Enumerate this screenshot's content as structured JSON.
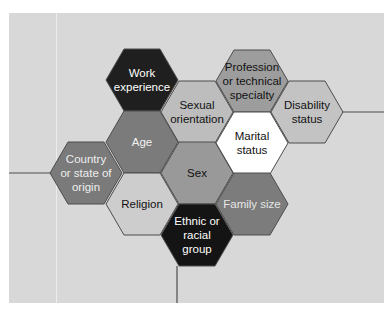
{
  "diagram": {
    "type": "hexagon-cluster",
    "hex_size": {
      "width": 72,
      "height": 62
    },
    "colors": {
      "panel_background": "#d8d8d8",
      "page_background": "#ffffff",
      "hex_border": "#4d4d4d",
      "connector_line": "#4d4d4d"
    },
    "hexagons": [
      {
        "id": "work-experience",
        "lines": [
          "Work",
          "experience"
        ],
        "cx": 142,
        "cy": 80,
        "fill": "#1f1f1f",
        "text_color": "#ffffff"
      },
      {
        "id": "profession",
        "lines": [
          "Profession",
          "or technical",
          "specialty"
        ],
        "cx": 252,
        "cy": 81,
        "fill": "#9d9d9d",
        "text_color": "#111111"
      },
      {
        "id": "sexual-orientation",
        "lines": [
          "Sexual",
          "orientation"
        ],
        "cx": 197,
        "cy": 112,
        "fill": "#bdbdbd",
        "text_color": "#111111"
      },
      {
        "id": "disability-status",
        "lines": [
          "Disability",
          "status"
        ],
        "cx": 307,
        "cy": 112,
        "fill": "#c3c3c3",
        "text_color": "#111111"
      },
      {
        "id": "age",
        "lines": [
          "Age"
        ],
        "cx": 142,
        "cy": 142,
        "fill": "#7b7b7b",
        "text_color": "#f2f2f2"
      },
      {
        "id": "marital-status",
        "lines": [
          "Marital",
          "status"
        ],
        "cx": 252,
        "cy": 143,
        "fill": "#ffffff",
        "text_color": "#111111"
      },
      {
        "id": "country-of-origin",
        "lines": [
          "Country",
          "or state of",
          "origin"
        ],
        "cx": 86,
        "cy": 173,
        "fill": "#7a7a7a",
        "text_color": "#eeeeee"
      },
      {
        "id": "sex",
        "lines": [
          "Sex"
        ],
        "cx": 197,
        "cy": 173,
        "fill": "#999999",
        "text_color": "#111111"
      },
      {
        "id": "religion",
        "lines": [
          "Religion"
        ],
        "cx": 142,
        "cy": 204,
        "fill": "#cdcdcd",
        "text_color": "#111111"
      },
      {
        "id": "family-size",
        "lines": [
          "Family size"
        ],
        "cx": 252,
        "cy": 204,
        "fill": "#7c7c7c",
        "text_color": "#e6e6e6"
      },
      {
        "id": "ethnic-group",
        "lines": [
          "Ethnic or",
          "racial",
          "group"
        ],
        "cx": 197,
        "cy": 235,
        "fill": "#141414",
        "text_color": "#ffffff"
      }
    ],
    "connectors": [
      {
        "id": "left-line",
        "x1": 9,
        "y1": 173,
        "x2": 50,
        "y2": 173
      },
      {
        "id": "right-line",
        "x1": 343,
        "y1": 112,
        "x2": 384,
        "y2": 112
      },
      {
        "id": "bottom-line",
        "x1": 177,
        "y1": 266,
        "x2": 177,
        "y2": 303
      }
    ]
  }
}
